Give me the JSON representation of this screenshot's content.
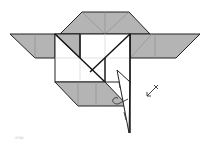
{
  "diagram": {
    "type": "origami-fold-diagram",
    "caption": "step",
    "colors": {
      "paper_colored_side": "#b4b4b4",
      "paper_white_side": "#ffffff",
      "line": "#222222"
    },
    "symbols": [
      {
        "name": "fold-arrow",
        "description": "arrow pointing down-left with x mark"
      },
      {
        "name": "fold-flap",
        "description": "triangular flap folded down"
      }
    ]
  }
}
